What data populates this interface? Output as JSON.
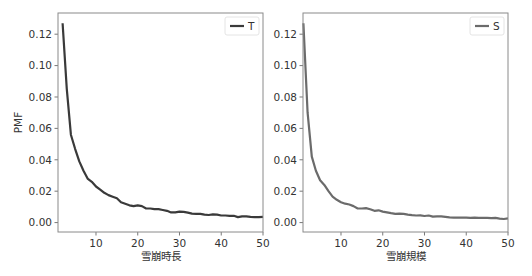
{
  "chart_data": [
    {
      "type": "line",
      "title": "",
      "xlabel": "雪崩時長",
      "ylabel": "PMF",
      "xlim": [
        0.9,
        50
      ],
      "ylim": [
        -0.006,
        0.1335
      ],
      "xticks": [
        10,
        20,
        30,
        40,
        50
      ],
      "yticks": [
        0.0,
        0.02,
        0.04,
        0.06,
        0.08,
        0.1,
        0.12
      ],
      "ytick_labels": [
        "0.00",
        "0.02",
        "0.04",
        "0.06",
        "0.08",
        "0.10",
        "0.12"
      ],
      "grid": false,
      "legend_position": "upper right",
      "series": [
        {
          "name": "T",
          "color": "#3a3a3a",
          "x": [
            2,
            3,
            4,
            5,
            6,
            7,
            8,
            9,
            10,
            11,
            12,
            13,
            14,
            15,
            16,
            17,
            18,
            19,
            20,
            21,
            22,
            23,
            24,
            25,
            26,
            27,
            28,
            29,
            30,
            31,
            32,
            33,
            34,
            35,
            36,
            37,
            38,
            39,
            40,
            41,
            42,
            43,
            44,
            45,
            46,
            47,
            48,
            49,
            50
          ],
          "y": [
            0.127,
            0.085,
            0.056,
            0.047,
            0.039,
            0.033,
            0.028,
            0.026,
            0.023,
            0.021,
            0.019,
            0.0175,
            0.0165,
            0.0155,
            0.013,
            0.012,
            0.011,
            0.0105,
            0.011,
            0.0105,
            0.009,
            0.009,
            0.0085,
            0.0085,
            0.008,
            0.0075,
            0.0065,
            0.0065,
            0.007,
            0.0068,
            0.0063,
            0.0057,
            0.0055,
            0.0055,
            0.005,
            0.0048,
            0.0052,
            0.005,
            0.0045,
            0.0045,
            0.0043,
            0.0043,
            0.0035,
            0.004,
            0.004,
            0.0037,
            0.0035,
            0.0035,
            0.0037
          ]
        }
      ]
    },
    {
      "type": "line",
      "title": "",
      "xlabel": "雪崩規模",
      "ylabel": "",
      "xlim": [
        0.9,
        50
      ],
      "ylim": [
        -0.006,
        0.1335
      ],
      "xticks": [
        10,
        20,
        30,
        40,
        50
      ],
      "yticks": [
        0.0,
        0.02,
        0.04,
        0.06,
        0.08,
        0.1,
        0.12
      ],
      "ytick_labels": [
        "0.00",
        "0.02",
        "0.04",
        "0.06",
        "0.08",
        "0.10",
        "0.12"
      ],
      "grid": false,
      "legend_position": "upper right",
      "series": [
        {
          "name": "S",
          "color": "#6b6b6b",
          "x": [
            1,
            2,
            3,
            4,
            5,
            6,
            7,
            8,
            9,
            10,
            11,
            12,
            13,
            14,
            15,
            16,
            17,
            18,
            19,
            20,
            21,
            22,
            23,
            24,
            25,
            26,
            27,
            28,
            29,
            30,
            31,
            32,
            33,
            34,
            35,
            36,
            37,
            38,
            39,
            40,
            41,
            42,
            43,
            44,
            45,
            46,
            47,
            48,
            49,
            50
          ],
          "y": [
            0.127,
            0.07,
            0.042,
            0.033,
            0.027,
            0.024,
            0.02,
            0.0165,
            0.0145,
            0.013,
            0.012,
            0.0115,
            0.0105,
            0.009,
            0.009,
            0.0092,
            0.0085,
            0.0075,
            0.0078,
            0.007,
            0.0065,
            0.006,
            0.0055,
            0.0057,
            0.0055,
            0.005,
            0.0047,
            0.0045,
            0.0046,
            0.0042,
            0.0045,
            0.0038,
            0.004,
            0.004,
            0.0037,
            0.0033,
            0.0032,
            0.0032,
            0.0032,
            0.0032,
            0.003,
            0.0031,
            0.003,
            0.003,
            0.003,
            0.0028,
            0.003,
            0.0025,
            0.0023,
            0.0027
          ]
        }
      ]
    }
  ],
  "panels": [
    {
      "legend_label": "T",
      "xlabel": "雪崩時長",
      "ylabel": "PMF"
    },
    {
      "legend_label": "S",
      "xlabel": "雪崩規模",
      "ylabel": ""
    }
  ]
}
